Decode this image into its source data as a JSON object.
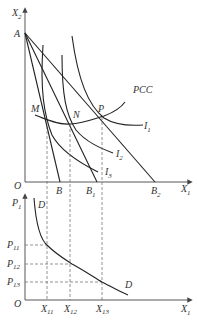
{
  "upper_panel": {
    "y_axis_label": "X",
    "y_axis_sub": "2",
    "x_axis_label": "X",
    "x_axis_sub": "1",
    "origin_label": "O",
    "intercept_label": "A",
    "budget_line_ends": [
      {
        "label": "B",
        "sub": ""
      },
      {
        "label": "B",
        "sub": "1"
      },
      {
        "label": "B",
        "sub": "2"
      }
    ],
    "tangency_points": [
      "M",
      "N",
      "P"
    ],
    "indifference_curves": [
      {
        "label": "I",
        "sub": "1"
      },
      {
        "label": "I",
        "sub": "2"
      },
      {
        "label": "I",
        "sub": "3"
      }
    ],
    "curve_label": "PCC"
  },
  "lower_panel": {
    "y_axis_label": "P",
    "y_axis_sub": "1",
    "x_axis_label": "X",
    "x_axis_sub": "1",
    "origin_label": "O",
    "demand_label": "D",
    "price_ticks": [
      {
        "label": "P",
        "sub": "11"
      },
      {
        "label": "P",
        "sub": "12"
      },
      {
        "label": "P",
        "sub": "13"
      }
    ],
    "quantity_ticks": [
      {
        "label": "X",
        "sub": "11"
      },
      {
        "label": "X",
        "sub": "12"
      },
      {
        "label": "X",
        "sub": "13"
      }
    ]
  }
}
